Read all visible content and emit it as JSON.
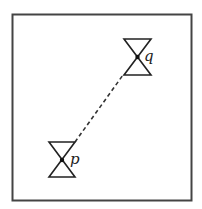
{
  "diagram": {
    "frame": {
      "stroke": "#444444"
    },
    "nodes": [
      {
        "id": "q",
        "label": "q",
        "shape": "hourglass",
        "center_dot": true
      },
      {
        "id": "p",
        "label": "p",
        "shape": "hourglass",
        "center_dot": true
      }
    ],
    "edges": [
      {
        "from": "p",
        "to": "q",
        "style": "dashed"
      }
    ],
    "colors": {
      "ink": "#222222",
      "background": "#ffffff"
    }
  }
}
